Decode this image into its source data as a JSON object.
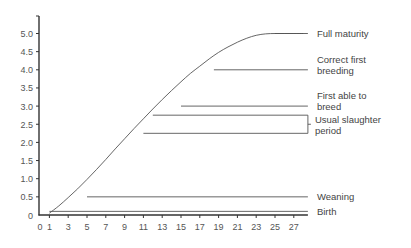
{
  "chart_data": {
    "type": "line",
    "title": "",
    "xlabel": "",
    "ylabel": "",
    "xlim": [
      0,
      28.5
    ],
    "ylim": [
      0,
      5.4
    ],
    "grid": false,
    "x_ticks": [
      0,
      1,
      3,
      5,
      7,
      9,
      11,
      13,
      15,
      17,
      19,
      21,
      23,
      25,
      27
    ],
    "x_tick_labels": [
      "0",
      "1",
      "3",
      "5",
      "7",
      "9",
      "11",
      "13",
      "15",
      "17",
      "19",
      "21",
      "23",
      "25",
      "27"
    ],
    "y_ticks": [
      0,
      0.5,
      1.0,
      1.5,
      2.0,
      2.5,
      3.0,
      3.5,
      4.0,
      4.5,
      5.0
    ],
    "y_tick_labels": [
      "0",
      "0.5",
      "1.0",
      "1.5",
      "2.0",
      "2.5",
      "3.0",
      "3.5",
      "4.0",
      "4.5",
      "5.0"
    ],
    "series": [
      {
        "name": "Growth curve",
        "x": [
          1,
          2,
          3,
          4,
          5,
          6,
          7,
          8,
          9,
          10,
          11,
          12,
          13,
          14,
          15,
          16,
          17,
          18,
          19,
          20,
          21,
          22,
          23,
          24,
          25,
          26,
          27,
          28
        ],
        "y": [
          0.05,
          0.25,
          0.48,
          0.72,
          0.98,
          1.25,
          1.53,
          1.82,
          2.1,
          2.38,
          2.65,
          2.92,
          3.18,
          3.43,
          3.67,
          3.9,
          4.1,
          4.3,
          4.48,
          4.63,
          4.76,
          4.87,
          4.95,
          4.99,
          5.0,
          5.0,
          5.0,
          5.0
        ]
      }
    ],
    "annotations": [
      {
        "label": "Full maturity",
        "y": 5.0,
        "x_start": 25,
        "x_end": 28.5
      },
      {
        "label": "Correct first breeding",
        "label_lines": [
          "Correct first",
          "breeding"
        ],
        "y": 4.0,
        "x_start": 18.5,
        "x_end": 28.5
      },
      {
        "label": "First able to breed",
        "label_lines": [
          "First able to",
          "breed"
        ],
        "y": 3.0,
        "x_start": 15,
        "x_end": 28.5
      },
      {
        "label": "Usual slaughter period",
        "label_lines": [
          "Usual slaughter",
          "period"
        ],
        "y_range": [
          2.25,
          2.75
        ],
        "x_start_top": 12,
        "x_start_bottom": 11,
        "x_end": 28.5,
        "bracket": true
      },
      {
        "label": "Weaning",
        "y": 0.5,
        "x_start": 5,
        "x_end": 28.5
      },
      {
        "label": "Birth",
        "y": 0.1,
        "x_start": 1,
        "x_end": 28.5
      }
    ]
  }
}
